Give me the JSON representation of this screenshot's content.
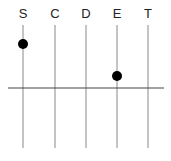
{
  "diagram": {
    "axes": [
      {
        "label": "S",
        "x": 23
      },
      {
        "label": "C",
        "x": 55
      },
      {
        "label": "D",
        "x": 86
      },
      {
        "label": "E",
        "x": 117
      },
      {
        "label": "T",
        "x": 148
      }
    ],
    "points": [
      {
        "axis": "S",
        "y": 44
      },
      {
        "axis": "E",
        "y": 76
      }
    ],
    "baseline_y": 88,
    "colors": {
      "axis": "#888888",
      "baseline": "#444444",
      "point": "#000000"
    }
  }
}
